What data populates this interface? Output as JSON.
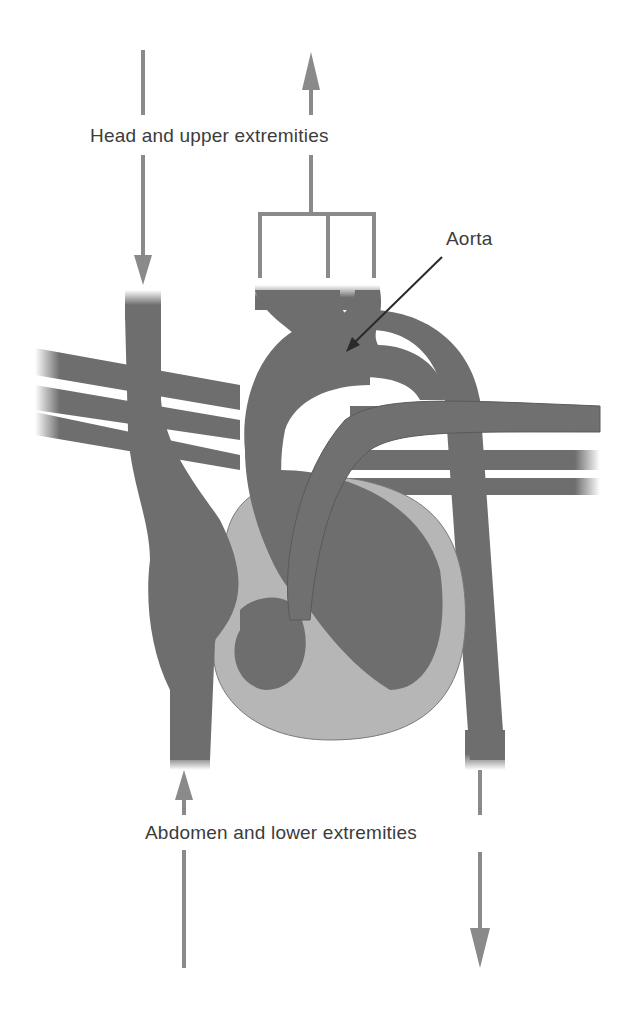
{
  "diagram": {
    "labels": {
      "head": "Head and upper extremities",
      "aorta": "Aorta",
      "abdomen": "Abdomen and lower extremities"
    },
    "colors": {
      "vessel": "#6e6e6e",
      "vessel_edge": "#555555",
      "myocardium": "#b6b6b6",
      "arrow": "#8a8a8a",
      "pointer": "#2a2a2a",
      "text": "#3c3c3c",
      "background": "#ffffff"
    },
    "arrows": [
      {
        "name": "svc-inflow-arrow",
        "direction": "down",
        "from": "Head and upper extremities",
        "to": "Superior vena cava"
      },
      {
        "name": "aortic-arch-outflow-arrow",
        "direction": "up",
        "from": "Aortic arch branches",
        "to": "Head and upper extremities"
      },
      {
        "name": "ivc-inflow-arrow",
        "direction": "up",
        "from": "Abdomen and lower extremities",
        "to": "Inferior vena cava"
      },
      {
        "name": "descending-aorta-outflow-arrow",
        "direction": "down",
        "from": "Descending aorta",
        "to": "Abdomen and lower extremities"
      }
    ]
  }
}
